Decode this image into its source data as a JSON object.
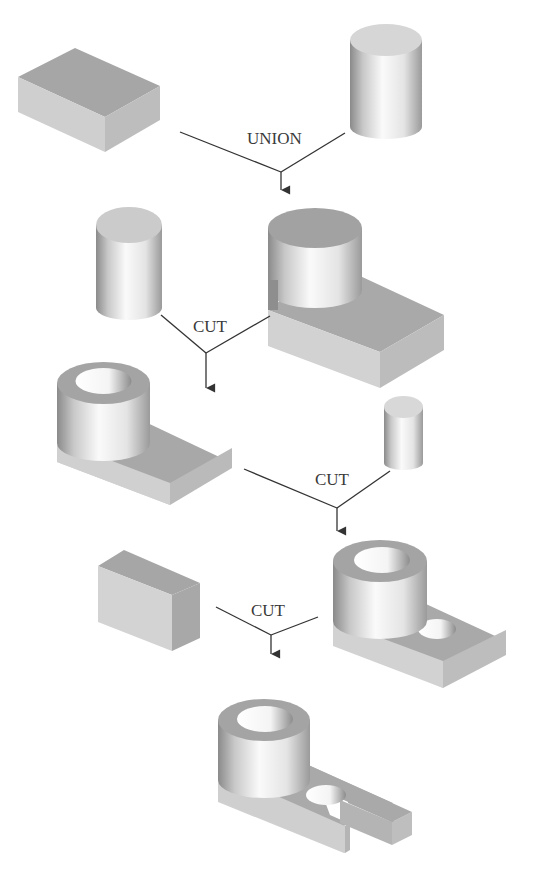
{
  "figure": {
    "cropped_caption": ""
  },
  "operations": [
    {
      "id": "op1",
      "label": "UNION",
      "inputs": [
        "rectangular block",
        "cylinder"
      ],
      "result": "cylinder on plate"
    },
    {
      "id": "op2",
      "label": "CUT",
      "inputs": [
        "cylinder",
        "cylinder on plate"
      ],
      "result": "tube on plate"
    },
    {
      "id": "op3",
      "label": "CUT",
      "inputs": [
        "tube on plate",
        "small cylinder"
      ],
      "result": "tube on plate with hole"
    },
    {
      "id": "op4",
      "label": "CUT",
      "inputs": [
        "block",
        "tube on plate with hole"
      ],
      "result": "slotted bracket"
    }
  ],
  "colors": {
    "background": "#ffffff",
    "line": "#333333",
    "solid_top": "#a9a9a9",
    "solid_side_light": "#d4d4d4",
    "solid_side_dark": "#9a9a9a"
  }
}
